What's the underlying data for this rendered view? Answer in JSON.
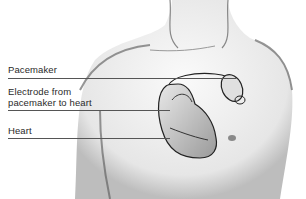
{
  "figure": {
    "labels": [
      {
        "id": "pacemaker",
        "text": "Pacemaker"
      },
      {
        "id": "electrode",
        "line1": "Electrode from",
        "line2": "pacemaker to heart"
      },
      {
        "id": "heart",
        "text": "Heart"
      }
    ],
    "colors": {
      "ink": "#2a2a2a",
      "shade": "#8a8a8a",
      "background": "#ffffff"
    }
  }
}
